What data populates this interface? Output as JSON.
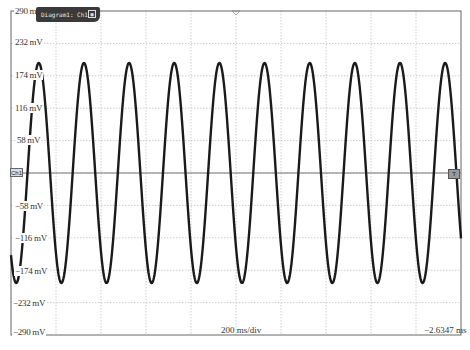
{
  "window": {
    "tag_label": "Diagram1: Ch1",
    "tag_icon": "maximize-icon",
    "channel_marker": "Ch1",
    "trigger_marker": "T"
  },
  "axis": {
    "y_labels": [
      "290 mV",
      "232 mV",
      "174 mV",
      "116 mV",
      "58 mV",
      "0",
      "−58 mV",
      "−116 mV",
      "−174 mV",
      "−232 mV",
      "−290 mV"
    ],
    "timebase": "200 ms/div",
    "time_offset": "−2.6347 ms"
  },
  "colors": {
    "trace": "#1a1a1a",
    "grid": "#b8b8b8",
    "border": "#555555",
    "tag_bg": "#3a3a3a"
  },
  "chart_data": {
    "type": "line",
    "title": "Diagram1: Ch1",
    "xlabel": "200 ms/div",
    "ylabel": "mV",
    "ylim": [
      -290,
      290
    ],
    "yticks": [
      290,
      232,
      174,
      116,
      58,
      0,
      -58,
      -116,
      -174,
      -232,
      -290
    ],
    "x_divisions": 10,
    "y_divisions": 10,
    "grid": true,
    "time_offset": "-2.6347 ms",
    "series": [
      {
        "name": "Ch1",
        "waveform": "sine",
        "amplitude_mV": 197,
        "offset_mV": 0,
        "cycles_visible": 10,
        "period_divisions": 1.0,
        "period_ms": 200,
        "peak_mV": 197,
        "trough_mV": -197
      }
    ]
  }
}
